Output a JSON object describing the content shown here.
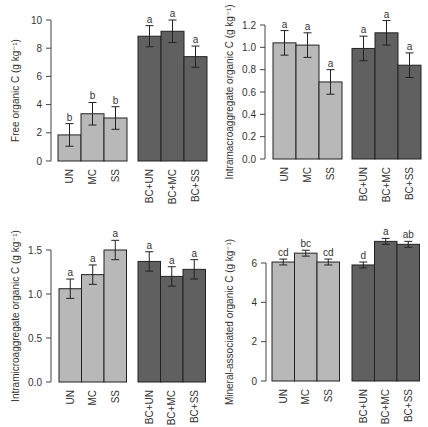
{
  "colors": {
    "untreated_fill": "#b8b8b8",
    "biochar_fill": "#606060",
    "stroke": "#222222",
    "axis": "#444444"
  },
  "chart_data": [
    {
      "type": "bar",
      "panel": "top-left",
      "ylabel": "Free organic C (g kg⁻¹)",
      "categories": [
        "UN",
        "MC",
        "SS",
        "BC+UN",
        "BC+MC",
        "BC+SS"
      ],
      "values": [
        1.85,
        3.35,
        3.05,
        8.85,
        9.2,
        7.4
      ],
      "errors": [
        0.8,
        0.8,
        0.8,
        0.75,
        0.8,
        0.75
      ],
      "letters": [
        "b",
        "b",
        "b",
        "a",
        "a",
        "a"
      ],
      "ylim": [
        0,
        10
      ],
      "yticks": [
        "0",
        "2",
        "4",
        "6",
        "8",
        "10"
      ],
      "ytick_values": [
        0,
        2,
        4,
        6,
        8,
        10
      ]
    },
    {
      "type": "bar",
      "panel": "top-right",
      "ylabel": "Intramacroaggregate organic  C (g kg⁻¹)",
      "categories": [
        "UN",
        "MC",
        "SS",
        "BC+UN",
        "BC+MC",
        "BC+SS"
      ],
      "values": [
        1.04,
        1.02,
        0.69,
        0.99,
        1.13,
        0.84
      ],
      "errors": [
        0.11,
        0.11,
        0.11,
        0.11,
        0.11,
        0.11
      ],
      "letters": [
        "a",
        "a",
        "a",
        "a",
        "a",
        "a"
      ],
      "ylim": [
        0,
        1.2
      ],
      "yticks": [
        "0.0",
        "0.2",
        "0.4",
        "0.6",
        "0.8",
        "1.0",
        "1.2"
      ],
      "ytick_values": [
        0,
        0.2,
        0.4,
        0.6,
        0.8,
        1.0,
        1.2
      ]
    },
    {
      "type": "bar",
      "panel": "bottom-left",
      "ylabel": "Intramicroaggregate organic  C (g kg⁻¹)",
      "categories": [
        "UN",
        "MC",
        "SS",
        "BC+UN",
        "BC+MC",
        "BC+SS"
      ],
      "values": [
        1.06,
        1.22,
        1.5,
        1.37,
        1.2,
        1.28
      ],
      "errors": [
        0.11,
        0.11,
        0.11,
        0.11,
        0.11,
        0.11
      ],
      "letters": [
        "a",
        "a",
        "a",
        "a",
        "a",
        "a"
      ],
      "ylim": [
        0,
        1.5
      ],
      "yticks": [
        "0.0",
        "0.5",
        "1.0",
        "1.5"
      ],
      "ytick_values": [
        0,
        0.5,
        1.0,
        1.5
      ]
    },
    {
      "type": "bar",
      "panel": "bottom-right",
      "ylabel": "Mineral-associated organic  C (g kg⁻¹)",
      "categories": [
        "UN",
        "MC",
        "SS",
        "BC+UN",
        "BC+MC",
        "BC+SS"
      ],
      "values": [
        6.05,
        6.5,
        6.05,
        5.9,
        7.1,
        6.95
      ],
      "errors": [
        0.15,
        0.15,
        0.15,
        0.15,
        0.15,
        0.15
      ],
      "letters": [
        "cd",
        "bc",
        "cd",
        "d",
        "a",
        "ab"
      ],
      "ylim": [
        0,
        6
      ],
      "yticks": [
        "0",
        "2",
        "4",
        "6"
      ],
      "ytick_values": [
        0,
        2,
        4,
        6
      ]
    }
  ]
}
